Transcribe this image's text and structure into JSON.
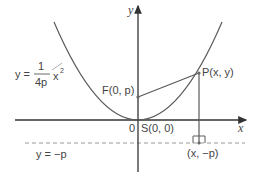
{
  "diagram": {
    "axes": {
      "x_label": "x",
      "y_label": "y",
      "origin_label": "0"
    },
    "equation": {
      "lhs": "y =",
      "numerator": "1",
      "denominator": "4p",
      "variable": "x",
      "exponent": "2"
    },
    "points": {
      "focus": "F(0, p)",
      "vertex": "S(0, 0)",
      "point": "P(x, y)",
      "foot": "(x, −p)"
    },
    "directrix_label": "y = −p",
    "colors": {
      "curve": "#5a5a5a",
      "axis": "#333333",
      "dashed": "#9a9a9a",
      "text": "#444444"
    }
  }
}
